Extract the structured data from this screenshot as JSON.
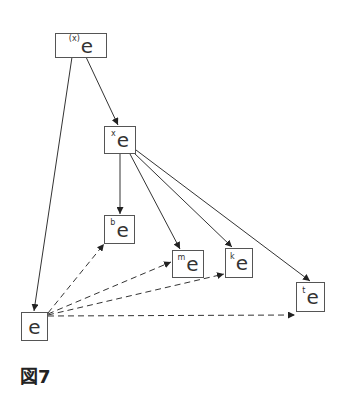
{
  "diagram": {
    "caption": "図7",
    "nodes": [
      {
        "id": "top",
        "sup": "(x)",
        "base": "e"
      },
      {
        "id": "x",
        "sup": "x",
        "base": "e"
      },
      {
        "id": "b",
        "sup": "b",
        "base": "e"
      },
      {
        "id": "m",
        "sup": "m",
        "base": "e"
      },
      {
        "id": "k",
        "sup": "k",
        "base": "e"
      },
      {
        "id": "t",
        "sup": "t",
        "base": "e"
      },
      {
        "id": "e",
        "sup": "",
        "base": "e"
      }
    ],
    "edges": [
      {
        "from": "top",
        "to": "x",
        "style": "solid"
      },
      {
        "from": "top",
        "to": "e",
        "style": "solid"
      },
      {
        "from": "x",
        "to": "b",
        "style": "solid"
      },
      {
        "from": "x",
        "to": "m",
        "style": "solid"
      },
      {
        "from": "x",
        "to": "k",
        "style": "solid"
      },
      {
        "from": "x",
        "to": "t",
        "style": "solid"
      },
      {
        "from": "e",
        "to": "b",
        "style": "dashed"
      },
      {
        "from": "e",
        "to": "m",
        "style": "dashed"
      },
      {
        "from": "e",
        "to": "k",
        "style": "dashed"
      },
      {
        "from": "e",
        "to": "t",
        "style": "dashed"
      }
    ]
  }
}
